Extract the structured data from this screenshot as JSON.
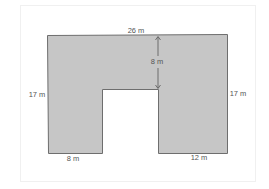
{
  "diagram": {
    "type": "composite-shape-area",
    "shape": "U-shaped rectangle with rectangular notch cut from bottom",
    "fill_color": "#c6c6c6",
    "stroke_color": "#6e6e6e",
    "labels": {
      "top_width": "26 m",
      "notch_depth": "8 m",
      "left_height": "17 m",
      "right_height": "17 m",
      "bottom_left_width": "8 m",
      "bottom_right_width": "12 m"
    },
    "dimensions_m": {
      "total_width": 26,
      "total_height": 17,
      "notch_depth": 8,
      "left_leg_width": 8,
      "right_leg_width": 12,
      "notch_width": 6
    }
  }
}
